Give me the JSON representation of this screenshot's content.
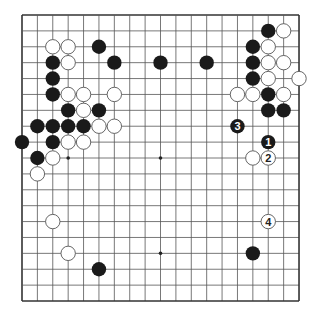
{
  "board": {
    "size": 19,
    "origin": {
      "x": 22,
      "y": 15
    },
    "spacing": {
      "x": 15.39,
      "y": 15.89
    },
    "stone_radius": 7.2,
    "colors": {
      "background": "#ffffff",
      "line": "#555555",
      "border": "#333333",
      "black": "#1a1a1a",
      "white": "#ffffff",
      "white_stroke": "#555555"
    },
    "star_points": [
      [
        3,
        3
      ],
      [
        9,
        3
      ],
      [
        15,
        3
      ],
      [
        3,
        9
      ],
      [
        9,
        9
      ],
      [
        15,
        9
      ],
      [
        3,
        15
      ],
      [
        9,
        15
      ],
      [
        15,
        15
      ]
    ],
    "black_stones": [
      [
        5,
        2
      ],
      [
        2,
        3
      ],
      [
        6,
        3
      ],
      [
        9,
        3
      ],
      [
        2,
        4
      ],
      [
        2,
        5
      ],
      [
        3,
        6
      ],
      [
        5,
        6
      ],
      [
        1,
        7
      ],
      [
        2,
        7
      ],
      [
        3,
        7
      ],
      [
        4,
        7
      ],
      [
        0,
        8
      ],
      [
        2,
        8
      ],
      [
        1,
        9
      ],
      [
        16,
        1
      ],
      [
        15,
        2
      ],
      [
        12,
        3
      ],
      [
        15,
        3
      ],
      [
        15,
        4
      ],
      [
        16,
        5
      ],
      [
        16,
        6
      ],
      [
        17,
        6
      ],
      [
        15,
        15
      ],
      [
        5,
        16
      ]
    ],
    "white_stones": [
      [
        2,
        2
      ],
      [
        3,
        2
      ],
      [
        3,
        3
      ],
      [
        3,
        5
      ],
      [
        4,
        5
      ],
      [
        6,
        5
      ],
      [
        4,
        6
      ],
      [
        5,
        7
      ],
      [
        6,
        7
      ],
      [
        3,
        8
      ],
      [
        4,
        8
      ],
      [
        2,
        9
      ],
      [
        1,
        10
      ],
      [
        17,
        1
      ],
      [
        16,
        2
      ],
      [
        16,
        3
      ],
      [
        17,
        3
      ],
      [
        16,
        4
      ],
      [
        18,
        4
      ],
      [
        14,
        5
      ],
      [
        15,
        5
      ],
      [
        17,
        5
      ],
      [
        15,
        9
      ],
      [
        2,
        13
      ],
      [
        3,
        15
      ]
    ],
    "numbered_moves": [
      {
        "number": "1",
        "color": "black",
        "col": 16,
        "row": 8
      },
      {
        "number": "2",
        "color": "white",
        "col": 16,
        "row": 9
      },
      {
        "number": "3",
        "color": "black",
        "col": 14,
        "row": 7
      },
      {
        "number": "4",
        "color": "white",
        "col": 16,
        "row": 13
      }
    ]
  }
}
